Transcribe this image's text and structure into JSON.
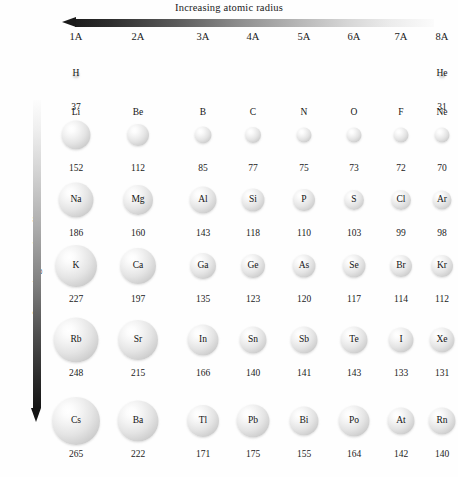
{
  "figure": {
    "title_top": "Increasing atomic radius",
    "title_left": "Increasing atomic radius",
    "background_color": "#fefefe",
    "text_color": "#1a1a1a",
    "arrow_dark_color": "#1a1a1a",
    "arrow_light_color": "#fbfbfb",
    "sphere_color": "#e4e4e4",
    "units_note": "picometers"
  },
  "group_headers": [
    {
      "label": "1A",
      "x": 76
    },
    {
      "label": "2A",
      "x": 138
    },
    {
      "label": "3A",
      "x": 203
    },
    {
      "label": "4A",
      "x": 253
    },
    {
      "label": "5A",
      "x": 304
    },
    {
      "label": "6A",
      "x": 354
    },
    {
      "label": "7A",
      "x": 401
    },
    {
      "label": "8A",
      "x": 442
    }
  ],
  "chart_data": {
    "type": "bubble",
    "xlabel": "Group",
    "ylabel": "Period",
    "value_label": "atomic radius (pm)",
    "x_categories": [
      "1A",
      "2A",
      "3A",
      "4A",
      "5A",
      "6A",
      "7A",
      "8A"
    ],
    "y_categories": [
      "1",
      "2",
      "3",
      "4",
      "5",
      "6"
    ],
    "annotations": [
      "Increasing atomic radius (left to right arrow, decreasing)",
      "Increasing atomic radius (top to bottom arrow)"
    ],
    "points": [
      {
        "symbol": "H",
        "group": "1A",
        "period": 1,
        "radius": 37
      },
      {
        "symbol": "He",
        "group": "8A",
        "period": 1,
        "radius": 31
      },
      {
        "symbol": "Li",
        "group": "1A",
        "period": 2,
        "radius": 152
      },
      {
        "symbol": "Be",
        "group": "2A",
        "period": 2,
        "radius": 112
      },
      {
        "symbol": "B",
        "group": "3A",
        "period": 2,
        "radius": 85
      },
      {
        "symbol": "C",
        "group": "4A",
        "period": 2,
        "radius": 77
      },
      {
        "symbol": "N",
        "group": "5A",
        "period": 2,
        "radius": 75
      },
      {
        "symbol": "O",
        "group": "6A",
        "period": 2,
        "radius": 73
      },
      {
        "symbol": "F",
        "group": "7A",
        "period": 2,
        "radius": 72
      },
      {
        "symbol": "Ne",
        "group": "8A",
        "period": 2,
        "radius": 70
      },
      {
        "symbol": "Na",
        "group": "1A",
        "period": 3,
        "radius": 186
      },
      {
        "symbol": "Mg",
        "group": "2A",
        "period": 3,
        "radius": 160
      },
      {
        "symbol": "Al",
        "group": "3A",
        "period": 3,
        "radius": 143
      },
      {
        "symbol": "Si",
        "group": "4A",
        "period": 3,
        "radius": 118
      },
      {
        "symbol": "P",
        "group": "5A",
        "period": 3,
        "radius": 110
      },
      {
        "symbol": "S",
        "group": "6A",
        "period": 3,
        "radius": 103
      },
      {
        "symbol": "Cl",
        "group": "7A",
        "period": 3,
        "radius": 99
      },
      {
        "symbol": "Ar",
        "group": "8A",
        "period": 3,
        "radius": 98
      },
      {
        "symbol": "K",
        "group": "1A",
        "period": 4,
        "radius": 227
      },
      {
        "symbol": "Ca",
        "group": "2A",
        "period": 4,
        "radius": 197
      },
      {
        "symbol": "Ga",
        "group": "3A",
        "period": 4,
        "radius": 135
      },
      {
        "symbol": "Ge",
        "group": "4A",
        "period": 4,
        "radius": 123
      },
      {
        "symbol": "As",
        "group": "5A",
        "period": 4,
        "radius": 120
      },
      {
        "symbol": "Se",
        "group": "6A",
        "period": 4,
        "radius": 117
      },
      {
        "symbol": "Br",
        "group": "7A",
        "period": 4,
        "radius": 114
      },
      {
        "symbol": "Kr",
        "group": "8A",
        "period": 4,
        "radius": 112
      },
      {
        "symbol": "Rb",
        "group": "1A",
        "period": 5,
        "radius": 248
      },
      {
        "symbol": "Sr",
        "group": "2A",
        "period": 5,
        "radius": 215
      },
      {
        "symbol": "In",
        "group": "3A",
        "period": 5,
        "radius": 166
      },
      {
        "symbol": "Sn",
        "group": "4A",
        "period": 5,
        "radius": 140
      },
      {
        "symbol": "Sb",
        "group": "5A",
        "period": 5,
        "radius": 141
      },
      {
        "symbol": "Te",
        "group": "6A",
        "period": 5,
        "radius": 143
      },
      {
        "symbol": "I",
        "group": "7A",
        "period": 5,
        "radius": 133
      },
      {
        "symbol": "Xe",
        "group": "8A",
        "period": 5,
        "radius": 131
      },
      {
        "symbol": "Cs",
        "group": "1A",
        "period": 6,
        "radius": 265
      },
      {
        "symbol": "Ba",
        "group": "2A",
        "period": 6,
        "radius": 222
      },
      {
        "symbol": "Tl",
        "group": "3A",
        "period": 6,
        "radius": 171
      },
      {
        "symbol": "Pb",
        "group": "4A",
        "period": 6,
        "radius": 175
      },
      {
        "symbol": "Bi",
        "group": "5A",
        "period": 6,
        "radius": 155
      },
      {
        "symbol": "Po",
        "group": "6A",
        "period": 6,
        "radius": 164
      },
      {
        "symbol": "At",
        "group": "7A",
        "period": 6,
        "radius": 142
      },
      {
        "symbol": "Rn",
        "group": "8A",
        "period": 6,
        "radius": 140
      }
    ]
  },
  "layout": {
    "column_x": {
      "1A": 76,
      "2A": 138,
      "3A": 203,
      "4A": 253,
      "5A": 304,
      "6A": 354,
      "7A": 401,
      "8A": 442
    },
    "row_y": {
      "1": 74,
      "2": 135,
      "3": 200,
      "4": 266,
      "5": 340,
      "6": 421
    },
    "label_inside_rows": [
      1,
      3,
      4,
      5,
      6
    ],
    "label_above_rows": [
      2
    ]
  }
}
